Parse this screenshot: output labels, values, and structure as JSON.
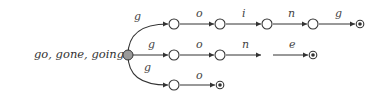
{
  "caption": "go, gone, going :",
  "automaton": {
    "start_state": "s0",
    "colors": {
      "start_fill": "#9a9a9a",
      "edge": "#333333",
      "node_stroke": "#333333",
      "node_fill": "#ffffff"
    },
    "paths": [
      {
        "word": "going",
        "labels": [
          "g",
          "o",
          "i",
          "n",
          "g"
        ]
      },
      {
        "word": "gone",
        "labels": [
          "g",
          "o",
          "n",
          "e"
        ]
      },
      {
        "word": "go",
        "labels": [
          "g",
          "o"
        ]
      }
    ]
  },
  "labels": {
    "r1": [
      "g",
      "o",
      "i",
      "n",
      "g"
    ],
    "r2": [
      "g",
      "o",
      "n",
      "e"
    ],
    "r3": [
      "g",
      "o"
    ]
  }
}
